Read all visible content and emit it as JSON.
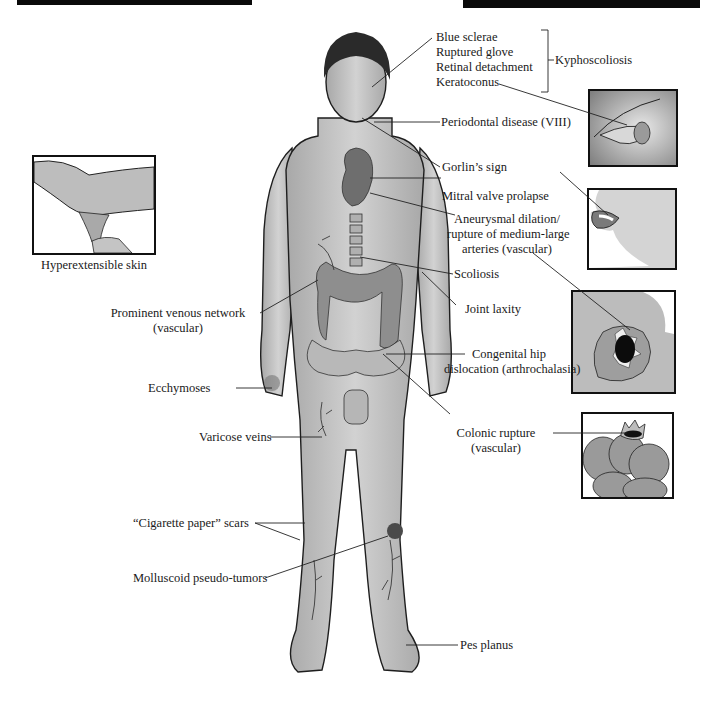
{
  "figure": {
    "caption_left": "Hyperextensible skin",
    "bracket_group": {
      "items": [
        "Blue sclerae",
        "Ruptured glove",
        "Retinal detachment",
        "Keratoconus"
      ],
      "group_label": "Kyphoscoliosis"
    },
    "labels_right": {
      "periodontal": "Periodontal disease (VIII)",
      "gorlin": "Gorlin’s sign",
      "mitral": "Mitral valve prolapse",
      "aneurysm_1": "Aneurysmal dilation/",
      "aneurysm_2": "rupture of medium-large",
      "aneurysm_3": "arteries (vascular)",
      "scoliosis": "Scoliosis",
      "joint_laxity": "Joint laxity",
      "hip_1": "Congenital hip",
      "hip_2": "dislocation (arthrochalasia)",
      "colonic_1": "Colonic rupture",
      "colonic_2": "(vascular)",
      "pes_planus": "Pes planus"
    },
    "labels_left": {
      "venous_1": "Prominent venous network",
      "venous_2": "(vascular)",
      "ecchymoses": "Ecchymoses",
      "varicose": "Varicose veins",
      "scars": "“Cigarette paper” scars",
      "molluscoid": "Molluscoid pseudo-tumors"
    },
    "insets": [
      "hyperextensible-skin",
      "keratoconus-eye",
      "gorlin-sign-mouth",
      "aneurysm-rupture",
      "colonic-rupture"
    ],
    "colors": {
      "skin": "#c9c9c9",
      "outline": "#1e1e1e",
      "banner": "#0a0a0a",
      "organ": "#6e6e6e"
    }
  }
}
